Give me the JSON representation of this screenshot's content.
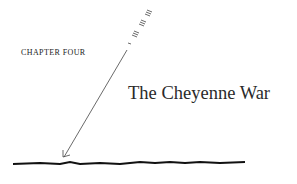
{
  "chapter_label": "CHAPTER FOUR",
  "title": "The Cheyenne War",
  "decorations": {
    "arrow": "arrow-pointing-down-left",
    "ground_line": "hand-drawn-horizontal-line"
  },
  "colors": {
    "ink": "#222222",
    "background": "#ffffff"
  }
}
